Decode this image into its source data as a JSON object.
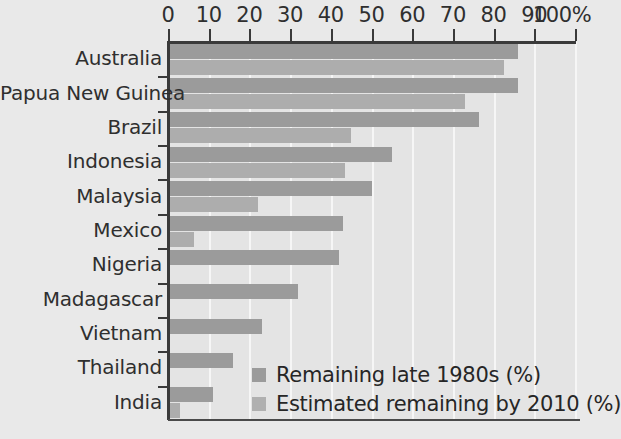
{
  "chart_data": {
    "type": "bar",
    "orientation": "horizontal",
    "title": "",
    "subtitle": "",
    "xlabel": "",
    "ylabel": "",
    "xlim": [
      0,
      100
    ],
    "xticks": [
      0,
      10,
      20,
      30,
      40,
      50,
      60,
      70,
      80,
      90,
      100
    ],
    "xtick_labels": [
      "0",
      "10",
      "20",
      "30",
      "40",
      "50",
      "60",
      "70",
      "80",
      "90",
      "100%"
    ],
    "grid": true,
    "grid_axis": "x",
    "legend_position": "inside-bottom-right",
    "categories": [
      "Australia",
      "Papua New Guinea",
      "Brazil",
      "Indonesia",
      "Malaysia",
      "Mexico",
      "Nigeria",
      "Madagascar",
      "Vietnam",
      "Thailand",
      "India"
    ],
    "series": [
      {
        "name": "Remaining late 1980s (%)",
        "color": "#9b9b9b",
        "values": [
          86,
          86,
          76.5,
          55,
          50,
          43,
          42,
          32,
          23,
          16,
          11
        ]
      },
      {
        "name": "Estimated remaining by 2010 (%)",
        "color": "#adadad",
        "values": [
          82.5,
          73,
          45,
          43.5,
          22,
          6.5,
          0,
          0,
          0,
          0,
          3
        ]
      }
    ]
  },
  "legend": {
    "items": [
      {
        "label": "Remaining late 1980s (%)",
        "swatch": "#9b9b9b"
      },
      {
        "label": "Estimated remaining by 2010 (%)",
        "swatch": "#b0b0b0"
      }
    ]
  },
  "colors": {
    "background": "#e9e9e9",
    "plot_background": "#e4e4e4",
    "gridline": "#f6f6f6",
    "axis": "#3a3a3a",
    "text": "#2f2f2f",
    "series_1": "#9b9b9b",
    "series_2": "#adadad"
  }
}
